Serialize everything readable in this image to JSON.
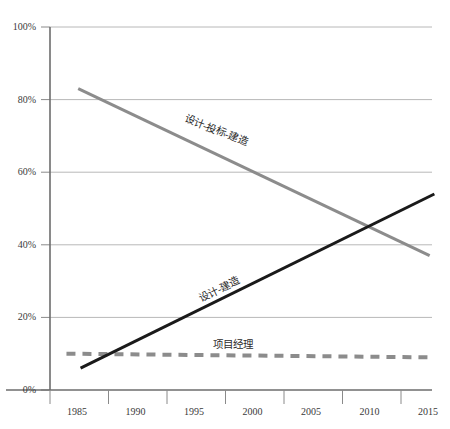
{
  "chart_data": {
    "type": "line",
    "title": "",
    "xlabel": "",
    "ylabel": "",
    "xlim": [
      1985,
      2017.5
    ],
    "ylim": [
      0,
      100
    ],
    "grid": true,
    "legend_position": "inline-labels",
    "x_tick_labels": [
      "1985",
      "1990",
      "1995",
      "2000",
      "2005",
      "2010",
      "2015"
    ],
    "x_ticks": [
      1985,
      1990,
      1995,
      2000,
      2005,
      2010,
      2015
    ],
    "y_tick_labels": [
      "0%",
      "20%",
      "40%",
      "60%",
      "80%",
      "100%"
    ],
    "y_ticks": [
      0,
      20,
      40,
      60,
      80,
      100
    ],
    "series": [
      {
        "name": "设计-投标-建造",
        "style": "solid",
        "color": "#8c8c8c",
        "width": 3,
        "x": [
          1987.4,
          2017.3
        ],
        "values": [
          83,
          37
        ],
        "label_x": 2000,
        "label_y": 61
      },
      {
        "name": "设计-建造",
        "style": "solid",
        "color": "#1a1a1a",
        "width": 3,
        "x": [
          1987.6,
          2017.7
        ],
        "values": [
          6,
          54
        ],
        "label_x": 1999,
        "label_y": 30
      },
      {
        "name": "项目经理",
        "style": "dashed",
        "color": "#8c8c8c",
        "width": 4,
        "x": [
          1986.4,
          2017.3
        ],
        "values": [
          10,
          9
        ],
        "label_x": 2002,
        "label_y": 16
      }
    ]
  },
  "axes": {
    "y_axis_name": "percentage-axis",
    "x_axis_name": "year-axis"
  }
}
